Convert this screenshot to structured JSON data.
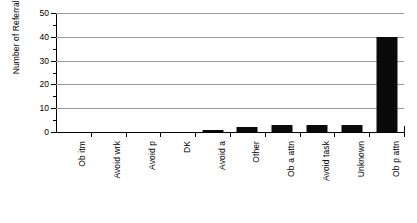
{
  "chart_data": {
    "type": "bar",
    "title": "",
    "xlabel": "",
    "ylabel": "Number of Referrals",
    "categories": [
      "Ob itm",
      "Avoid wrk",
      "Avoid p",
      "DK",
      "Avoid a",
      "Other",
      "Ob a attn",
      "Avoid task",
      "Unknown",
      "Ob p attn"
    ],
    "values": [
      0,
      0,
      0,
      0,
      1,
      2,
      3,
      3,
      3,
      40
    ],
    "ylim": [
      0,
      50
    ],
    "yticks": [
      0,
      10,
      20,
      30,
      40,
      50
    ],
    "ytick_labels": [
      "0",
      "10",
      "20",
      "30",
      "40",
      "50"
    ],
    "yminor_ticks": [
      5,
      15,
      25,
      35,
      45
    ],
    "grid": "horizontal-major",
    "legend": "none",
    "bar_color": "#0a0a0a",
    "grid_color": "#9a9a9a",
    "axis_color": "#000000",
    "background": "#ffffff"
  }
}
